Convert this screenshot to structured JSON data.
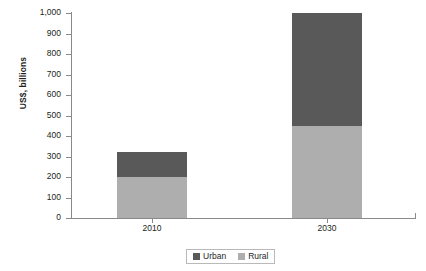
{
  "chart_data": {
    "type": "bar",
    "subtype": "stacked",
    "title": "",
    "xlabel": "",
    "ylabel": "US$, billions",
    "categories": [
      "2010",
      "2030"
    ],
    "series": [
      {
        "name": "Urban",
        "color": "#595959",
        "values": [
          120,
          550
        ]
      },
      {
        "name": "Rural",
        "color": "#aeaeae",
        "values": [
          200,
          450
        ]
      }
    ],
    "stack_order": [
      "Rural",
      "Urban"
    ],
    "totals": [
      320,
      1000
    ],
    "ylim": [
      0,
      1000
    ],
    "ytick_values": [
      0,
      100,
      200,
      300,
      400,
      500,
      600,
      700,
      800,
      900,
      1000
    ],
    "ytick_labels": [
      "0",
      "100",
      "200",
      "300",
      "400",
      "500",
      "600",
      "700",
      "800",
      "900",
      "1,000"
    ],
    "grid": false,
    "legend_position": "bottom-center",
    "legend_entries": [
      "Urban",
      "Rural"
    ]
  },
  "axis": {
    "y_title": "US$, billions"
  },
  "legend": {
    "items": [
      {
        "label": "Urban",
        "color": "#595959"
      },
      {
        "label": "Rural",
        "color": "#aeaeae"
      }
    ]
  },
  "colors": {
    "urban": "#595959",
    "rural": "#aeaeae",
    "axis": "#8a8a8a",
    "text": "#231f20",
    "background": "#ffffff",
    "legend_border": "#b9b9b9"
  }
}
